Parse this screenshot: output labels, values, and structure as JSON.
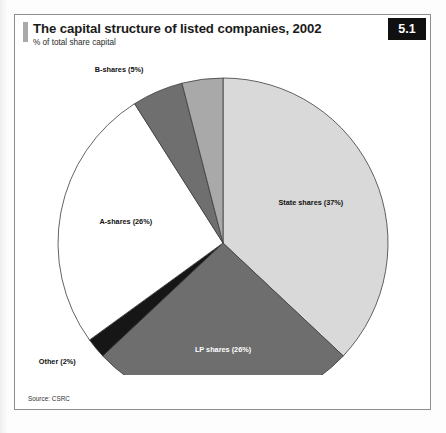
{
  "figure": {
    "title": "The capital structure of listed companies, 2002",
    "subtitle": "% of total share capital",
    "number": "5.1",
    "source": "Source: CSRC"
  },
  "chart_data": {
    "type": "pie",
    "title": "The capital structure of listed companies, 2002",
    "subtitle": "% of total share capital",
    "xlabel": "",
    "ylabel": "% of total share capital",
    "legend_position": "none",
    "grid": false,
    "start_angle_deg": 0,
    "direction": "clockwise",
    "units": "percent",
    "total": 100,
    "categories": [
      "State shares",
      "LP shares",
      "Other",
      "A-shares",
      "B-shares",
      "H-shares"
    ],
    "values": [
      37,
      26,
      2,
      26,
      5,
      4
    ],
    "labels": [
      "State shares (37%)",
      "LP shares (26%)",
      "Other (2%)",
      "A-shares (26%)",
      "B-shares (5%)",
      "H-shares (4%)"
    ],
    "colors": [
      "#d9d9d9",
      "#6e6e6e",
      "#161616",
      "#ffffff",
      "#6f6f6f",
      "#a9a9a9"
    ],
    "slices": [
      {
        "name": "State shares",
        "value": 37,
        "label": "State shares (37%)",
        "color": "#d9d9d9",
        "label_color": "#111111"
      },
      {
        "name": "LP shares",
        "value": 26,
        "label": "LP shares (26%)",
        "color": "#6e6e6e",
        "label_color": "#ffffff"
      },
      {
        "name": "Other",
        "value": 2,
        "label": "Other (2%)",
        "color": "#161616",
        "label_color": "#111111"
      },
      {
        "name": "A-shares",
        "value": 26,
        "label": "A-shares (26%)",
        "color": "#ffffff",
        "label_color": "#111111"
      },
      {
        "name": "B-shares",
        "value": 5,
        "label": "B-shares (5%)",
        "color": "#6f6f6f",
        "label_color": "#111111"
      },
      {
        "name": "H-shares",
        "value": 4,
        "label": "H-shares (4%)",
        "color": "#a9a9a9",
        "label_color": "#111111"
      }
    ]
  }
}
